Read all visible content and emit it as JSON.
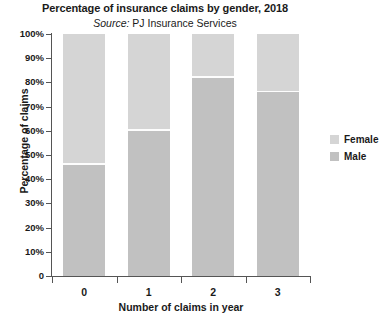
{
  "chart_data": {
    "type": "bar",
    "subtype": "stacked-percentage",
    "title": "Percentage of insurance claims by gender, 2018",
    "subtitle_prefix": "Source:",
    "subtitle_text": "PJ Insurance Services",
    "xlabel": "Number of claims in year",
    "ylabel": "Percentage of claims",
    "categories": [
      "0",
      "1",
      "2",
      "3"
    ],
    "ylim": [
      0,
      100
    ],
    "ytick_values": [
      100,
      90,
      80,
      70,
      60,
      50,
      40,
      30,
      20,
      10,
      0
    ],
    "ytick_labels": [
      "100%",
      "90%",
      "80%",
      "70%",
      "60%",
      "50%",
      "40%",
      "30%",
      "20%",
      "10%",
      "0"
    ],
    "grid": false,
    "legend_position": "right",
    "series": [
      {
        "name": "Female",
        "color": "#d5d5d5",
        "values": [
          54,
          40,
          18,
          24
        ]
      },
      {
        "name": "Male",
        "color": "#c1c1c1",
        "values": [
          46,
          60,
          82,
          76
        ]
      }
    ]
  },
  "legend": {
    "items": [
      {
        "label": "Female",
        "color": "#d5d5d5"
      },
      {
        "label": "Male",
        "color": "#c1c1c1"
      }
    ]
  },
  "colors": {
    "female": "#d5d5d5",
    "male": "#c1c1c1",
    "axis": "#555555",
    "text": "#1a1a1a",
    "background": "#ffffff"
  }
}
